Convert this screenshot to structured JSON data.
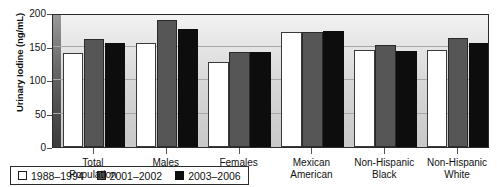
{
  "chart_data": {
    "type": "bar",
    "title": "",
    "xlabel": "",
    "ylabel": "Urinary Iodine (ng/mL)",
    "ylim": [
      0,
      200
    ],
    "yticks": [
      0,
      50,
      100,
      150,
      200
    ],
    "ytick_labels": [
      "0",
      "50",
      "100",
      "150",
      "200"
    ],
    "grid": true,
    "legend_position": "inside-bottom-left",
    "categories": [
      "Total Population",
      "Males",
      "Females",
      "Mexican American",
      "Non-Hispanic Black",
      "Non-Hispanic White"
    ],
    "category_lines": [
      [
        "Total",
        "Population"
      ],
      [
        "Males",
        ""
      ],
      [
        "Females",
        ""
      ],
      [
        "Mexican",
        "American"
      ],
      [
        "Non-Hispanic",
        "Black"
      ],
      [
        "Non-Hispanic",
        "White"
      ]
    ],
    "series": [
      {
        "name": "1988–1994",
        "color": "#ffffff",
        "values": [
          141,
          155,
          127,
          171,
          145,
          145
        ]
      },
      {
        "name": "2001–2002",
        "color": "#565656",
        "values": [
          161,
          190,
          142,
          172,
          152,
          163
        ]
      },
      {
        "name": "2003–2006",
        "color": "#0d0d0d",
        "values": [
          155,
          176,
          142,
          173,
          143,
          155
        ]
      }
    ]
  }
}
